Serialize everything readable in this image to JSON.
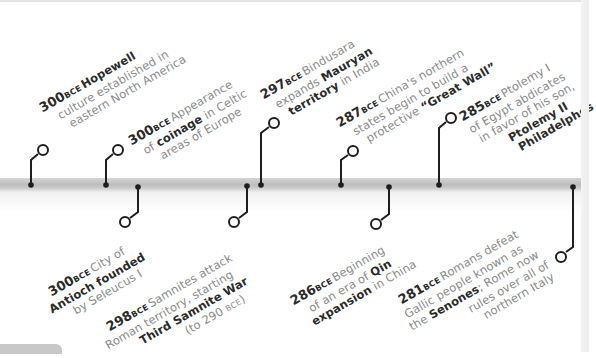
{
  "timeline": {
    "era_suffix": "BCE",
    "colors": {
      "bar": "#c4c4c4",
      "connector": "#1e1e1e",
      "text_bold": "#2a2a2a",
      "text_light": "#8a8a8a"
    },
    "events": [
      {
        "id": "hopewell",
        "year": "300",
        "position": "above",
        "lines": [
          {
            "parts": [
              {
                "t": "Hopewell",
                "b": true
              }
            ]
          },
          {
            "parts": [
              {
                "t": "culture established in",
                "b": false
              }
            ]
          },
          {
            "parts": [
              {
                "t": "eastern North America",
                "b": false
              }
            ]
          }
        ]
      },
      {
        "id": "coinage",
        "year": "300",
        "position": "above",
        "lines": [
          {
            "parts": [
              {
                "t": "Appearance",
                "b": false
              }
            ]
          },
          {
            "parts": [
              {
                "t": "of ",
                "b": false
              },
              {
                "t": "coinage",
                "b": true
              },
              {
                "t": " in Celtic",
                "b": false
              }
            ]
          },
          {
            "parts": [
              {
                "t": "areas of Europe",
                "b": false
              }
            ]
          }
        ]
      },
      {
        "id": "antioch",
        "year": "300",
        "position": "below",
        "lines": [
          {
            "parts": [
              {
                "t": "City of",
                "b": false
              }
            ]
          },
          {
            "parts": [
              {
                "t": "Antioch founded",
                "b": true
              }
            ]
          },
          {
            "parts": [
              {
                "t": "by Seleucus I",
                "b": false
              }
            ]
          }
        ]
      },
      {
        "id": "samnite",
        "year": "298",
        "position": "below",
        "lines": [
          {
            "parts": [
              {
                "t": "Samnites attack",
                "b": false
              }
            ]
          },
          {
            "parts": [
              {
                "t": "Roman territory, starting",
                "b": false
              }
            ]
          },
          {
            "parts": [
              {
                "t": "Third Samnite War",
                "b": true
              }
            ]
          },
          {
            "parts": [
              {
                "t": "(to 290 ",
                "b": false
              },
              {
                "t": "BCE",
                "era": true
              },
              {
                "t": ")",
                "b": false
              }
            ]
          }
        ]
      },
      {
        "id": "mauryan",
        "year": "297",
        "position": "above",
        "lines": [
          {
            "parts": [
              {
                "t": "Bindusara",
                "b": false
              }
            ]
          },
          {
            "parts": [
              {
                "t": "expands ",
                "b": false
              },
              {
                "t": "Mauryan",
                "b": true
              }
            ]
          },
          {
            "parts": [
              {
                "t": "territory",
                "b": true
              },
              {
                "t": " in India",
                "b": false
              }
            ]
          }
        ]
      },
      {
        "id": "great-wall",
        "year": "287",
        "position": "above",
        "lines": [
          {
            "parts": [
              {
                "t": "China's northern",
                "b": false
              }
            ]
          },
          {
            "parts": [
              {
                "t": "states begin to build a",
                "b": false
              }
            ]
          },
          {
            "parts": [
              {
                "t": "protective ",
                "b": false
              },
              {
                "t": "“Great Wall”",
                "b": true
              }
            ]
          }
        ]
      },
      {
        "id": "qin",
        "year": "286",
        "position": "below",
        "lines": [
          {
            "parts": [
              {
                "t": "Beginning",
                "b": false
              }
            ]
          },
          {
            "parts": [
              {
                "t": "of an era of ",
                "b": false
              },
              {
                "t": "Qin",
                "b": true
              }
            ]
          },
          {
            "parts": [
              {
                "t": "expansion",
                "b": true
              },
              {
                "t": " in China",
                "b": false
              }
            ]
          }
        ]
      },
      {
        "id": "ptolemy",
        "year": "285",
        "position": "above",
        "lines": [
          {
            "parts": [
              {
                "t": "Ptolemy I",
                "b": false
              }
            ]
          },
          {
            "parts": [
              {
                "t": "of Egypt abdicates",
                "b": false
              }
            ]
          },
          {
            "parts": [
              {
                "t": "in favor of his son,",
                "b": false
              }
            ]
          },
          {
            "parts": [
              {
                "t": "Ptolemy II",
                "b": true
              }
            ]
          },
          {
            "parts": [
              {
                "t": "Philadelphos",
                "b": true
              }
            ]
          }
        ]
      },
      {
        "id": "senones",
        "year": "281",
        "position": "below",
        "lines": [
          {
            "parts": [
              {
                "t": "Romans defeat",
                "b": false
              }
            ]
          },
          {
            "parts": [
              {
                "t": "Gallic people known as",
                "b": false
              }
            ]
          },
          {
            "parts": [
              {
                "t": "the ",
                "b": false
              },
              {
                "t": "Senones",
                "b": true
              },
              {
                "t": "; Rome now",
                "b": false
              }
            ]
          },
          {
            "parts": [
              {
                "t": "rules over all of",
                "b": false
              }
            ]
          },
          {
            "parts": [
              {
                "t": "northern Italy",
                "b": false
              }
            ]
          }
        ]
      }
    ]
  }
}
